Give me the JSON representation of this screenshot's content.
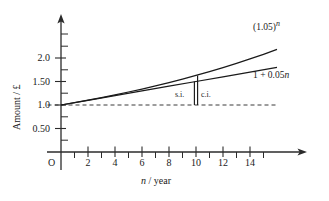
{
  "chart_data": {
    "type": "line",
    "title": "",
    "xlabel": "n / year",
    "ylabel": "Amount / £",
    "xlim": [
      -1.2,
      16.5
    ],
    "ylim": [
      -0.45,
      2.45
    ],
    "grid": false,
    "legend_position": "inline-right",
    "x_ticks_major": [
      2,
      4,
      6,
      8,
      10,
      12,
      14
    ],
    "x_tick_labels": [
      "2",
      "4",
      "6",
      "8",
      "10",
      "12",
      "14"
    ],
    "x_ticks_minor": [
      1,
      3,
      5,
      7,
      9,
      11,
      13,
      15
    ],
    "y_ticks_major": [
      0.5,
      1.0,
      1.5,
      2.0
    ],
    "y_tick_labels": [
      "0.50",
      "1.0",
      "1.50",
      "2.0"
    ],
    "y_ticks_minor": [
      0.25,
      0.75,
      1.25,
      1.75,
      2.25
    ],
    "origin_label": "O",
    "reference_line": {
      "y": 1.0,
      "style": "dashed",
      "x_from": -1.0,
      "x_to": 16.0
    },
    "annotation_marker": {
      "x": 10,
      "y_from": 1.0,
      "y_to_simple": 1.5,
      "y_to_compound": 1.6289,
      "style": "double-vertical-bar"
    },
    "series": [
      {
        "name": "compound-interest",
        "label": "(1.05)ⁿ",
        "label_base": "(1.05)",
        "label_exponent": "n",
        "formula": "y = 1.05^x",
        "x": [
          0,
          1,
          2,
          3,
          4,
          5,
          6,
          7,
          8,
          9,
          10,
          11,
          12,
          13,
          14,
          15,
          16
        ],
        "y": [
          1.0,
          1.05,
          1.1025,
          1.1576,
          1.2155,
          1.2763,
          1.3401,
          1.4071,
          1.4775,
          1.5513,
          1.6289,
          1.7103,
          1.7959,
          1.8856,
          1.9799,
          2.0789,
          2.1829
        ]
      },
      {
        "name": "simple-interest",
        "label": "1 + 0.05n",
        "label_prefix": "1 + 0.05",
        "label_variable": "n",
        "formula": "y = 1 + 0.05x",
        "x": [
          0,
          2,
          4,
          6,
          8,
          10,
          12,
          14,
          16
        ],
        "y": [
          1.0,
          1.1,
          1.2,
          1.3,
          1.4,
          1.5,
          1.6,
          1.7,
          1.8
        ]
      }
    ],
    "annotations": [
      {
        "name": "simple-interest-marker-label",
        "text": "s.i.",
        "x": 9.2,
        "y": 1.27
      },
      {
        "name": "compound-interest-marker-label",
        "text": "c.i.",
        "x": 10.6,
        "y": 1.27
      }
    ]
  },
  "labels": {
    "y_axis_title": "Amount / £",
    "x_axis_title_variable": "n",
    "x_axis_title_unit": " / year",
    "origin": "O",
    "compound_curve_base": "(1.05)",
    "compound_curve_exponent": "n",
    "simple_curve_text": "1 + 0.05",
    "simple_curve_variable": "n",
    "si_marker": "s.i.",
    "ci_marker": "c.i."
  },
  "colors": {
    "background": "#ffffff",
    "axis": "#2b2b2b",
    "curve": "#1a1a1a",
    "dashed": "#3a3a3a",
    "text": "#1a1a1a"
  }
}
